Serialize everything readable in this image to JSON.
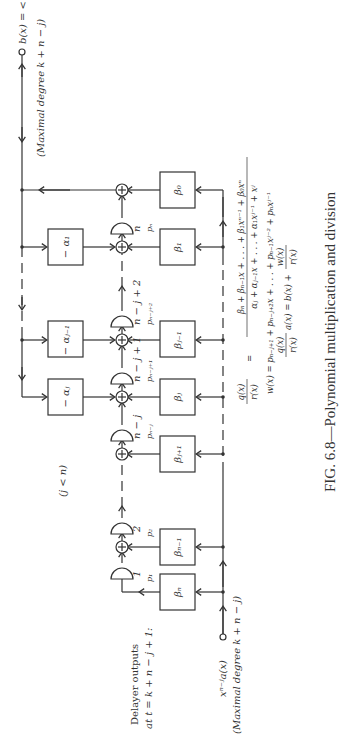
{
  "figure": {
    "caption": "FIG. 6.8—Polynomial multiplication and division",
    "condition": "(j < n)",
    "input": {
      "label": "x^{n−j}a(x)",
      "label_text": "xⁿ⁻ʲa(x)",
      "degree_note": "(Maximal degree k + n − j)"
    },
    "output": {
      "label_text": "b(x) = <q(x)/r(x) a(x)>",
      "degree_note": "(Maximal degree k + n − j)"
    },
    "delayer_note": {
      "line1": "Delayer outputs",
      "line2": "at t = k + n − j + 1:"
    },
    "feedback_boxes": [
      {
        "label": "− αⱼ"
      },
      {
        "label": "− αⱼ₋₁"
      },
      {
        "label": "− α₁"
      }
    ],
    "feedforward_boxes": [
      {
        "label": "βₙ"
      },
      {
        "label": "βₙ₋₁"
      },
      {
        "label": "βⱼ₊₁"
      },
      {
        "label": "βⱼ"
      },
      {
        "label": "βⱼ₋₁"
      },
      {
        "label": "β₁"
      },
      {
        "label": "β₀"
      }
    ],
    "delay_elements": [
      {
        "index": "1",
        "output": "p₁"
      },
      {
        "index": "2",
        "output": "p₂"
      },
      {
        "index": "n − j",
        "output": "pₙ₋ⱼ"
      },
      {
        "index": "n − j + 1",
        "output": "pₙ₋ⱼ₊₁"
      },
      {
        "index": "n − j + 2",
        "output": "pₙ₋ⱼ₊₂"
      },
      {
        "index": "n",
        "output": "pₙ"
      }
    ],
    "equations": [
      "q(x)/r(x) = (βₙ + βₙ₋₁x + . . . + β₁xⁿ⁻¹ + β₀xⁿ) / (αⱼ + αⱼ₋₁x + . . . + α₁xʲ⁻¹ + xʲ)",
      "w(x) = pₙ₋ⱼ₊₁ + pₙ₋ⱼ₊₂x + . . . + pₙ₋₁xʲ⁻² + pₙxʲ⁻¹",
      "q(x)/r(x) a(x) = b(x) + w(x)/r(x)"
    ],
    "eq_parts": {
      "eq1_lhs_num": "q(x)",
      "eq1_lhs_den": "r(x)",
      "eq1_num": "βₙ + βₙ₋₁x + . . . + β₁xⁿ⁻¹ + β₀xⁿ",
      "eq1_den": "αⱼ + αⱼ₋₁x + . . . + α₁xʲ⁻¹ + xʲ",
      "eq2": "w(x) = pₙ₋ⱼ₊₁ + pₙ₋ⱼ₊₂x + . . . + pₙ₋₁xʲ⁻² + pₙxʲ⁻¹",
      "eq3_mid": "a(x) = b(x) +",
      "eq3_num2": "w(x)",
      "eq3_den2": "r(x)",
      "eq_sign": "="
    }
  },
  "symbols": {
    "adder": "⊕",
    "adder_icon": "circle-plus-icon",
    "delay_icon": "d-shaped-delay-icon",
    "input_node": "open-circle-terminal",
    "output_node": "open-circle-terminal"
  }
}
